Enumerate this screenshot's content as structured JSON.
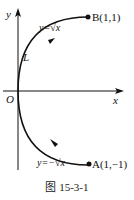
{
  "figure": {
    "caption": "图 15-3-1",
    "axes": {
      "x_label": "x",
      "y_label": "y",
      "origin_label": "O"
    },
    "curve": {
      "name": "L",
      "upper_label": "y=√x",
      "lower_label": "y=−√x",
      "direction": "from A to B"
    },
    "points": [
      {
        "label": "B(1,1)",
        "x": 1,
        "y": 1
      },
      {
        "label": "A(1,−1)",
        "x": 1,
        "y": -1
      }
    ],
    "colors": {
      "ink": "#111111"
    }
  }
}
